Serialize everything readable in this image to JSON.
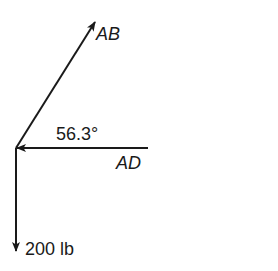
{
  "diagram": {
    "type": "free-body force diagram",
    "origin": {
      "x": 16,
      "y": 148
    },
    "forces": [
      {
        "name": "AB",
        "label": "AB",
        "direction": "up-right",
        "italic": true
      },
      {
        "name": "AD",
        "label": "AD",
        "direction": "left (toward origin)",
        "italic": true
      },
      {
        "name": "weight",
        "label": "200 lb",
        "direction": "down",
        "italic": false
      }
    ],
    "angle_label": "56.3°",
    "colors": {
      "stroke": "#1a1a1a",
      "background": "#ffffff"
    }
  },
  "labels": {
    "ab": "AB",
    "ad": "AD",
    "angle": "56.3°",
    "weight": "200 lb"
  }
}
